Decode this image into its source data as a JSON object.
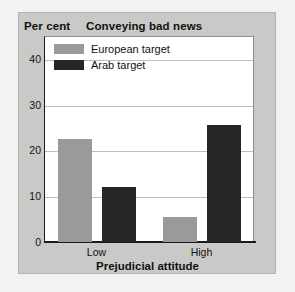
{
  "chart_data": {
    "type": "bar",
    "title": "Conveying bad news",
    "ylabel": "Per cent",
    "xlabel": "Prejudicial attitude",
    "categories": [
      "Low",
      "High"
    ],
    "series": [
      {
        "name": "European target",
        "color": "#9a9a9a",
        "values": [
          22.5,
          5.5
        ]
      },
      {
        "name": "Arab target",
        "color": "#262626",
        "values": [
          12,
          25.5
        ]
      }
    ],
    "ylim": [
      0,
      45
    ],
    "yticks": [
      0,
      10,
      20,
      30,
      40
    ],
    "ytick_labels": [
      "0",
      "10",
      "20",
      "30",
      "40"
    ],
    "grid": true,
    "legend_position": "top-left"
  },
  "legend": {
    "items": [
      {
        "label": "European target",
        "swatch": "european-swatch"
      },
      {
        "label": "Arab target",
        "swatch": "arab-swatch"
      }
    ]
  }
}
